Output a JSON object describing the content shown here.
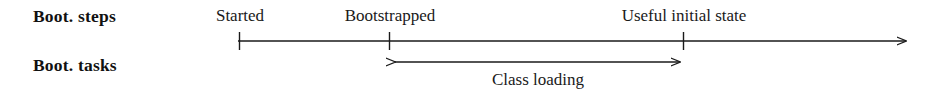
{
  "figure": {
    "background_color": "#ffffff",
    "stroke_color": "#1a1a1a",
    "width": 935,
    "height": 100
  },
  "rows": [
    {
      "key": "steps",
      "label": "Boot. steps"
    },
    {
      "key": "tasks",
      "label": "Boot. tasks"
    }
  ],
  "timeline": {
    "axis_y": 41,
    "axis_start_x": 238,
    "axis_end_x": 912,
    "arrow_end": true,
    "milestones": [
      {
        "label": "Started",
        "x": 240,
        "tick": true
      },
      {
        "label": "Bootstrapped",
        "x": 390,
        "tick": true
      },
      {
        "label": "Useful initial state",
        "x": 684,
        "tick": true
      }
    ]
  },
  "spans": [
    {
      "label": "Class loading",
      "start_x": 389,
      "end_x": 686,
      "y": 62,
      "label_center_x": 538,
      "arrow_start": true,
      "arrow_end": true
    }
  ]
}
